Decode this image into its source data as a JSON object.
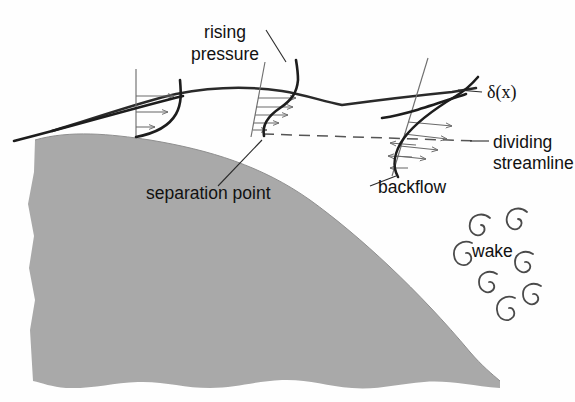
{
  "figure": {
    "background_color": "#ffffff",
    "body_color": "#a9a9a9",
    "line_color": "#1d1d1d",
    "accent_color": "#6a6a6a"
  },
  "labels": {
    "rising_pressure_line1": "rising",
    "rising_pressure_line2": "pressure",
    "delta": "δ(x)",
    "dividing_line1": "dividing",
    "dividing_line2": "streamline",
    "separation_point": "separation point",
    "backflow": "backflow",
    "wake": "wake"
  },
  "diagram_data": {
    "type": "schematic",
    "description": "Flow over a convex solid body showing boundary layer growth, the separation point, backflow and the downstream wake.",
    "solid_body": {
      "name": "curved solid surface",
      "fill": "#a9a9a9",
      "texture": "grainy stipple",
      "edges": [
        "irregular torn left edge",
        "irregular torn bottom edge",
        "smooth convex upper-right boundary"
      ]
    },
    "velocity_profiles": [
      {
        "name": "attached-profile",
        "station": "upstream",
        "axis_x": 136,
        "arrows": 3,
        "flow_direction": "forward",
        "wall_shear": "positive",
        "note": "attached boundary layer, full forward flow"
      },
      {
        "name": "separation-profile",
        "station": "separation point",
        "axis_x": 258,
        "arrows": 6,
        "flow_direction": "forward",
        "wall_shear": "zero",
        "note": "zero velocity gradient at the wall"
      },
      {
        "name": "backflow-profile",
        "station": "downstream of separation",
        "axis_x": 410,
        "arrows_forward": 4,
        "arrows_reverse": 2,
        "flow_direction": "forward above dividing streamline, reversed below",
        "wall_shear": "negative",
        "note": "reversed near-wall flow (backflow)"
      }
    ],
    "features": [
      {
        "name": "boundary-layer-edge",
        "label": "δ(x)"
      },
      {
        "name": "dividing-streamline",
        "style": "dashed"
      },
      {
        "name": "separation-point",
        "x": 264,
        "y": 136
      },
      {
        "name": "wake-eddies",
        "count": 7
      }
    ]
  }
}
